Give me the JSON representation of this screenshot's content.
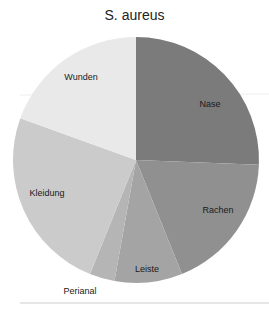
{
  "chart_data": {
    "type": "pie",
    "title": "S. aureus",
    "start_angle_deg": 0,
    "direction": "clockwise",
    "slices": [
      {
        "label": "Nase",
        "percent": 25.6,
        "color": "#7b7b7b"
      },
      {
        "label": "Rachen",
        "percent": 18.3,
        "color": "#909090"
      },
      {
        "label": "Leiste",
        "percent": 8.9,
        "color": "#a4a4a4"
      },
      {
        "label": "Perianal",
        "percent": 3.3,
        "color": "#b5b5b5"
      },
      {
        "label": "Kleidung",
        "percent": 24.4,
        "color": "#cbcbcb"
      },
      {
        "label": "Wunden",
        "percent": 19.5,
        "color": "#e9e9e9"
      }
    ],
    "legend": "none (labels on slices)"
  }
}
